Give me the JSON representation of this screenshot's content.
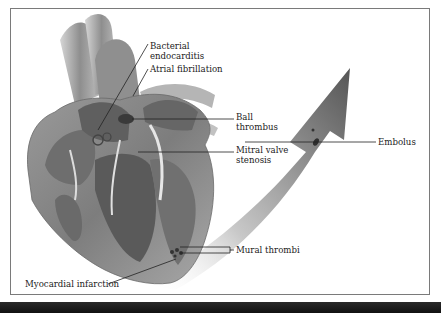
{
  "figure": {
    "frame_color": "#7a7a7a",
    "bottom_bar_color": "#1a1a1a",
    "arrow_color": "#6e6e6e",
    "heart_color": "#8c8c8c"
  },
  "labels": {
    "bacterial_endocarditis": [
      "Bacterial",
      "endocarditis"
    ],
    "atrial_fibrillation": "Atrial fibrillation",
    "ball_thrombus": [
      "Ball",
      "thrombus"
    ],
    "mitral_valve_stenosis": [
      "Mitral valve",
      "stenosis"
    ],
    "embolus": "Embolus",
    "mural_thrombi": "Mural thrombi",
    "myocardial_infarction": "Myocardial infarction"
  }
}
